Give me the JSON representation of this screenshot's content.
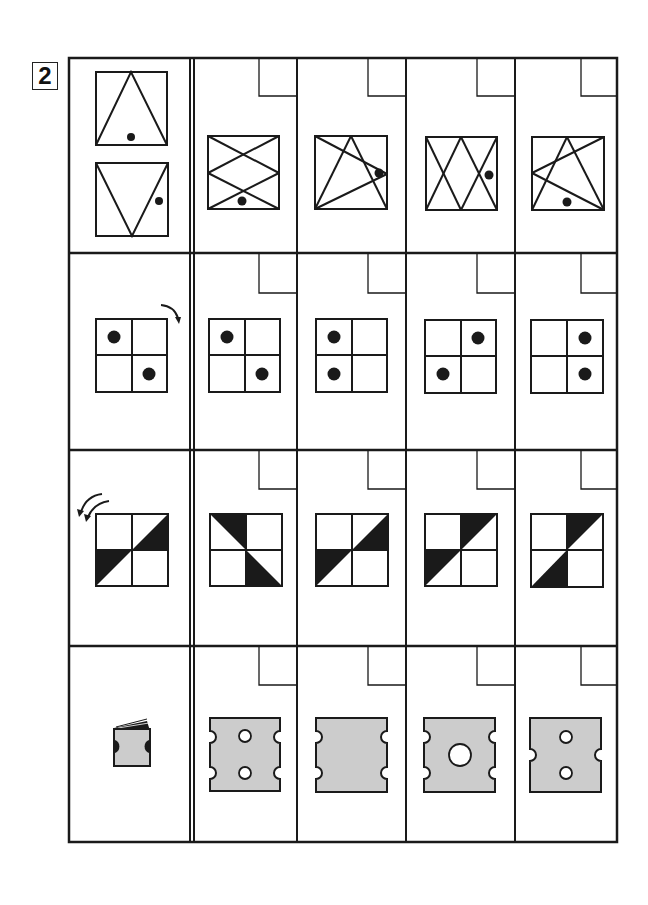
{
  "problem_number": "2",
  "colors": {
    "line": "#1a1a1a",
    "fill_gray": "#cccccc",
    "paper": "#ffffff"
  },
  "grid": {
    "rows": 4,
    "answer_columns": 4,
    "answer_box_label": ""
  },
  "rows": [
    {
      "id": "row-1",
      "prompt": {
        "type": "triangle-pair",
        "description": "Two squares: upward triangle with dot at bottom center; downward triangle with dot at right"
      },
      "options": [
        {
          "description": "Square with X pattern (two overlapping diamonds), dot at bottom"
        },
        {
          "description": "Square with triangle and lines meeting at right, dot at right"
        },
        {
          "description": "Square with two overlapping V shapes, dot at right"
        },
        {
          "description": "Square with triangle and lines meeting at left, dot at bottom"
        }
      ]
    },
    {
      "id": "row-2",
      "prompt": {
        "type": "rotate-clockwise",
        "arrow": "clockwise-arrow",
        "dots": [
          "top-left",
          "bottom-right"
        ]
      },
      "options": [
        {
          "dots": [
            "top-left",
            "bottom-right"
          ]
        },
        {
          "dots": [
            "top-left",
            "bottom-left"
          ]
        },
        {
          "dots": [
            "top-right",
            "bottom-left"
          ]
        },
        {
          "dots": [
            "top-right",
            "bottom-right"
          ]
        }
      ]
    },
    {
      "id": "row-3",
      "prompt": {
        "type": "rotate-counterclockwise-twice",
        "arrow": "double-counterclockwise-arrow",
        "shaded": [
          "top-right-lower-triangle",
          "bottom-left-upper-triangle"
        ]
      },
      "options": [
        {
          "shaded": [
            "top-left-upper-triangle",
            "bottom-right-lower-triangle"
          ]
        },
        {
          "shaded": [
            "top-right-lower-triangle",
            "bottom-left-upper-triangle"
          ]
        },
        {
          "shaded": [
            "top-right-upper-triangle",
            "bottom-left-upper-triangle"
          ]
        },
        {
          "shaded": [
            "top-right-upper-triangle",
            "bottom-left-lower-triangle"
          ]
        }
      ]
    },
    {
      "id": "row-4",
      "prompt": {
        "type": "folded-paper",
        "description": "Folded gray paper with half-circle cuts on both sides"
      },
      "options": [
        {
          "notches_left": 2,
          "notches_right": 2,
          "holes": 2,
          "hole_size": "small"
        },
        {
          "notches_left": 2,
          "notches_right": 2,
          "holes": 0,
          "hole_size": "none"
        },
        {
          "notches_left": 2,
          "notches_right": 2,
          "holes": 1,
          "hole_size": "large"
        },
        {
          "notches_left": 1,
          "notches_right": 1,
          "holes": 2,
          "hole_size": "small"
        }
      ]
    }
  ]
}
